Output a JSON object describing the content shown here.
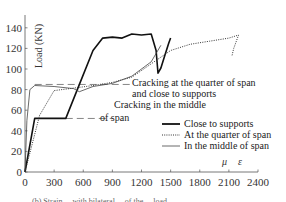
{
  "chart_data": {
    "type": "line",
    "title": "",
    "xlabel": "μ ε",
    "ylabel": "Load (KN)",
    "xlim": [
      0,
      2400
    ],
    "ylim": [
      0,
      150
    ],
    "x_ticks": [
      "0",
      "300",
      "600",
      "900",
      "1200",
      "1500",
      "1800",
      "2100",
      "2400"
    ],
    "y_ticks": [
      "0",
      "20",
      "40",
      "60",
      "80",
      "100",
      "120",
      "140"
    ],
    "grid": false,
    "legend_position": "lower right",
    "series": [
      {
        "name": "Close to supports",
        "style": "solid-thick",
        "x": [
          0,
          100,
          420,
          560,
          700,
          800,
          900,
          1000,
          1100,
          1200,
          1300,
          1350,
          1370,
          1400,
          1440,
          1480,
          1500
        ],
        "y": [
          0,
          52,
          52,
          85,
          118,
          130,
          131,
          130,
          134,
          133,
          134,
          118,
          96,
          101,
          113,
          125,
          130
        ]
      },
      {
        "name": "At the quarter of span",
        "style": "dotted",
        "x": [
          0,
          150,
          300,
          550,
          700,
          900,
          1100,
          1300,
          1500,
          1700,
          1900,
          2100,
          2200,
          2150,
          2130
        ],
        "y": [
          0,
          55,
          79,
          82,
          84,
          87,
          92,
          105,
          118,
          124,
          127,
          130,
          133,
          120,
          112
        ]
      },
      {
        "name": "In the middle of span",
        "style": "solid-thin",
        "x": [
          0,
          20,
          50,
          100,
          300,
          500,
          560,
          700,
          900,
          1100,
          1300,
          1400
        ],
        "y": [
          0,
          50,
          80,
          84,
          83,
          81,
          78,
          83,
          86,
          93,
          107,
          123
        ]
      }
    ],
    "reference_lines": [
      {
        "label": "Cracking at the quarter of span and close to supports",
        "y": 85,
        "x_from": 100,
        "x_to": 1100,
        "style": "dashed"
      },
      {
        "label": "Cracking in the middle of span",
        "y": 52,
        "x_from": 420,
        "x_to": 900,
        "style": "dashed"
      }
    ],
    "annotations": [
      "Cracking at the quarter of span",
      "and close to supports",
      "Cracking in the middle",
      "of span"
    ]
  },
  "axes": {
    "ylabel": "Load (KN)",
    "xlabel_mu": "μ",
    "xlabel_eps": "ε"
  },
  "annotations": {
    "quarter_line1": "Cracking at the quarter of span",
    "quarter_line2": "and close to supports",
    "middle_line1": "Cracking in the middle",
    "middle_line2": "of span"
  },
  "legend": {
    "items": [
      {
        "label": "Close to supports"
      },
      {
        "label": "At the quarter of span"
      },
      {
        "label": "In the middle of span"
      }
    ]
  },
  "caption": "(b) Strain ... with bilateral ... of the ... load ..."
}
